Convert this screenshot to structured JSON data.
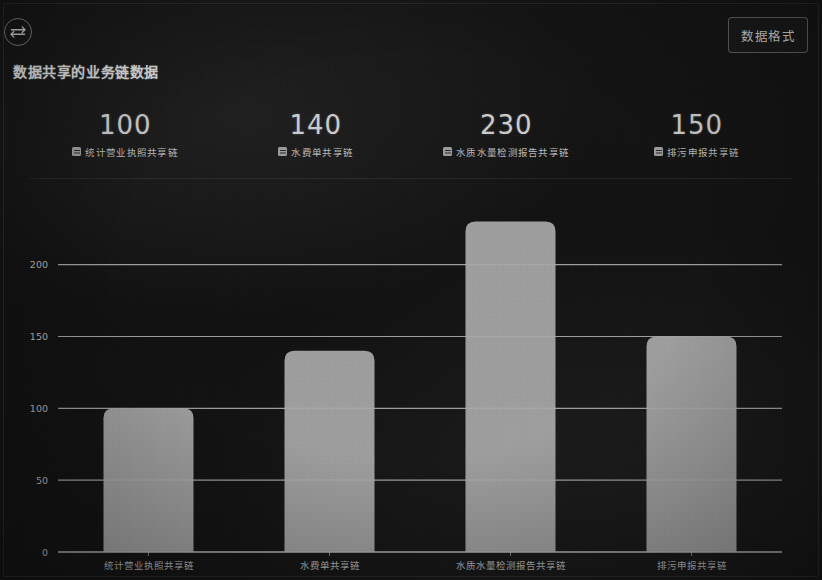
{
  "header": {
    "swap_icon": "swap-vertical-icon",
    "title": "数据共享的业务链数据",
    "format_button_label": "数据格式"
  },
  "stats": [
    {
      "value": "100",
      "label": "统计营业执照共享链",
      "icon": "legend-swatch-icon"
    },
    {
      "value": "140",
      "label": "水费单共享链",
      "icon": "legend-swatch-icon"
    },
    {
      "value": "230",
      "label": "水质水量检测报告共享链",
      "icon": "legend-swatch-icon"
    },
    {
      "value": "150",
      "label": "排污申报共享链",
      "icon": "legend-swatch-icon"
    }
  ],
  "colors": {
    "bar": "#adadad",
    "grid": "#c9c9c9",
    "axis_text": "#b4b4b4",
    "background": "#131313",
    "accent_text": "#e2e2e2"
  },
  "chart_data": {
    "type": "bar",
    "title": "数据共享的业务链数据",
    "xlabel": "",
    "ylabel": "",
    "categories": [
      "统计营业执照共享链",
      "水费单共享链",
      "水质水量检测报告共享链",
      "排污申报共享链"
    ],
    "values": [
      100,
      140,
      230,
      150
    ],
    "series": [
      {
        "name": "共享数据量",
        "values": [
          100,
          140,
          230,
          150
        ]
      }
    ],
    "yticks": [
      0,
      50,
      100,
      150,
      200
    ],
    "ytick_labels": [
      "0",
      "50",
      "100",
      "150",
      "200"
    ],
    "ylim": [
      0,
      245
    ],
    "grid": true,
    "grid_axis": "y",
    "legend": false,
    "bar_color": "#adadad"
  }
}
